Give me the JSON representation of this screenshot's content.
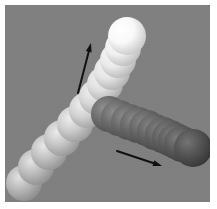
{
  "figure": {
    "canvas": {
      "width": 205,
      "height": 197,
      "offset_x": 5,
      "offset_y": 5,
      "background_color": "#808080",
      "page_background_color": "#ffffff"
    }
  },
  "chart_data": {
    "type": "scatter",
    "subtitle": "",
    "xlabel": "",
    "ylabel": "",
    "xlim": [
      0,
      205
    ],
    "ylim": [
      0,
      197
    ],
    "grid": false,
    "legend_position": "none",
    "annotations": [
      {
        "name": "bright-chain-direction-arrow",
        "label": "",
        "x1": 73,
        "y1": 88,
        "x2": 86,
        "y2": 38,
        "color": "#111111",
        "width": 2.0,
        "head_length": 9,
        "head_width": 6
      },
      {
        "name": "dark-chain-direction-arrow",
        "label": "",
        "x1": 112,
        "y1": 146,
        "x2": 157,
        "y2": 161,
        "color": "#111111",
        "width": 2.0,
        "head_length": 9,
        "head_width": 6
      }
    ],
    "series": [
      {
        "name": "bright-sphere-chain",
        "marker": "sphere",
        "direction": "lower-left to upper-right",
        "radius": 18,
        "highlight_offset": [
          -0.3,
          -0.32
        ],
        "points": [
          {
            "x": 19,
            "y": 178,
            "radius": 18,
            "base_color": "#b9b9b9",
            "highlight_color": "#e2e2e2",
            "shadow_color": "#8c8c8c"
          },
          {
            "x": 31,
            "y": 162,
            "radius": 18,
            "base_color": "#bdbdbd",
            "highlight_color": "#e5e5e5",
            "shadow_color": "#8f8f8f"
          },
          {
            "x": 44,
            "y": 147,
            "radius": 18,
            "base_color": "#c2c2c2",
            "highlight_color": "#e8e8e8",
            "shadow_color": "#939393"
          },
          {
            "x": 57,
            "y": 133,
            "radius": 18,
            "base_color": "#c7c7c7",
            "highlight_color": "#ebebeb",
            "shadow_color": "#979797"
          },
          {
            "x": 70,
            "y": 119,
            "radius": 18,
            "base_color": "#cdcdcd",
            "highlight_color": "#eeeeee",
            "shadow_color": "#9c9c9c"
          },
          {
            "x": 82,
            "y": 105,
            "radius": 18,
            "base_color": "#d3d3d3",
            "highlight_color": "#f0f0f0",
            "shadow_color": "#a1a1a1"
          },
          {
            "x": 92,
            "y": 92,
            "radius": 18,
            "base_color": "#d9d9d9",
            "highlight_color": "#f2f2f2",
            "shadow_color": "#a6a6a6"
          },
          {
            "x": 100,
            "y": 79,
            "radius": 18,
            "base_color": "#dfdfdf",
            "highlight_color": "#f4f4f4",
            "shadow_color": "#ababab"
          },
          {
            "x": 107,
            "y": 67,
            "radius": 18,
            "base_color": "#e5e5e5",
            "highlight_color": "#f7f7f7",
            "shadow_color": "#b1b1b1"
          },
          {
            "x": 113,
            "y": 55,
            "radius": 18,
            "base_color": "#ebebeb",
            "highlight_color": "#f9f9f9",
            "shadow_color": "#b7b7b7"
          },
          {
            "x": 118,
            "y": 43,
            "radius": 18,
            "base_color": "#f1f1f1",
            "highlight_color": "#fbfbfb",
            "shadow_color": "#bdbdbd"
          },
          {
            "x": 122,
            "y": 31,
            "radius": 19,
            "base_color": "#f9f9f9",
            "highlight_color": "#ffffff",
            "shadow_color": "#c8c8c8"
          }
        ]
      },
      {
        "name": "dark-sphere-chain",
        "marker": "sphere",
        "direction": "junction to lower-right",
        "radius": 18,
        "highlight_offset": [
          -0.3,
          -0.32
        ],
        "points": [
          {
            "x": 104,
            "y": 109,
            "radius": 18,
            "base_color": "#6e6e6e",
            "highlight_color": "#909090",
            "shadow_color": "#4f4f4f"
          },
          {
            "x": 114,
            "y": 113,
            "radius": 18,
            "base_color": "#6c6c6c",
            "highlight_color": "#8e8e8e",
            "shadow_color": "#4d4d4d"
          },
          {
            "x": 124,
            "y": 117,
            "radius": 18,
            "base_color": "#6a6a6a",
            "highlight_color": "#8c8c8c",
            "shadow_color": "#4b4b4b"
          },
          {
            "x": 133,
            "y": 120,
            "radius": 18,
            "base_color": "#686868",
            "highlight_color": "#8a8a8a",
            "shadow_color": "#494949"
          },
          {
            "x": 142,
            "y": 123,
            "radius": 18,
            "base_color": "#666666",
            "highlight_color": "#888888",
            "shadow_color": "#474747"
          },
          {
            "x": 150,
            "y": 127,
            "radius": 18,
            "base_color": "#646464",
            "highlight_color": "#868686",
            "shadow_color": "#454545"
          },
          {
            "x": 158,
            "y": 130,
            "radius": 18,
            "base_color": "#626262",
            "highlight_color": "#838383",
            "shadow_color": "#434343"
          },
          {
            "x": 165,
            "y": 133,
            "radius": 18,
            "base_color": "#606060",
            "highlight_color": "#818181",
            "shadow_color": "#414141"
          },
          {
            "x": 171,
            "y": 136,
            "radius": 18,
            "base_color": "#5e5e5e",
            "highlight_color": "#7f7f7f",
            "shadow_color": "#3f3f3f"
          },
          {
            "x": 177,
            "y": 139,
            "radius": 18,
            "base_color": "#5c5c5c",
            "highlight_color": "#7d7d7d",
            "shadow_color": "#3d3d3d"
          },
          {
            "x": 188,
            "y": 143,
            "radius": 19,
            "base_color": "#555555",
            "highlight_color": "#747474",
            "shadow_color": "#363636"
          }
        ]
      }
    ]
  }
}
